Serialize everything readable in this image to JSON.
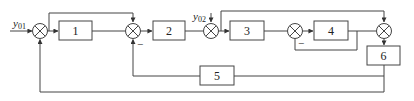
{
  "diagram": {
    "type": "control-system-block-diagram",
    "stroke_color": "#444444",
    "inputs": [
      {
        "id": "y01",
        "label": "y",
        "subscript": "01"
      },
      {
        "id": "y02",
        "label": "y",
        "subscript": "02"
      }
    ],
    "blocks": [
      {
        "id": "b1",
        "label": "1"
      },
      {
        "id": "b2",
        "label": "2"
      },
      {
        "id": "b3",
        "label": "3"
      },
      {
        "id": "b4",
        "label": "4"
      },
      {
        "id": "b5",
        "label": "5"
      },
      {
        "id": "b6",
        "label": "6"
      }
    ],
    "junctions": [
      {
        "id": "s1",
        "inputs": [
          "y01",
          "feedback from 6 (bottom loop)"
        ]
      },
      {
        "id": "s2",
        "inputs": [
          "output of 1",
          "feedforward from s1 output",
          "feedback via 5 (negative)"
        ]
      },
      {
        "id": "s3",
        "inputs": [
          "output of 2",
          "y02"
        ]
      },
      {
        "id": "s4",
        "inputs": [
          "output of 3",
          "feedback from 4 output (negative)"
        ]
      },
      {
        "id": "s5",
        "inputs": [
          "output of 4",
          "feedforward from s3 output"
        ]
      }
    ],
    "signs": {
      "s2_bottom": "−",
      "s4_bottom": "−"
    }
  }
}
